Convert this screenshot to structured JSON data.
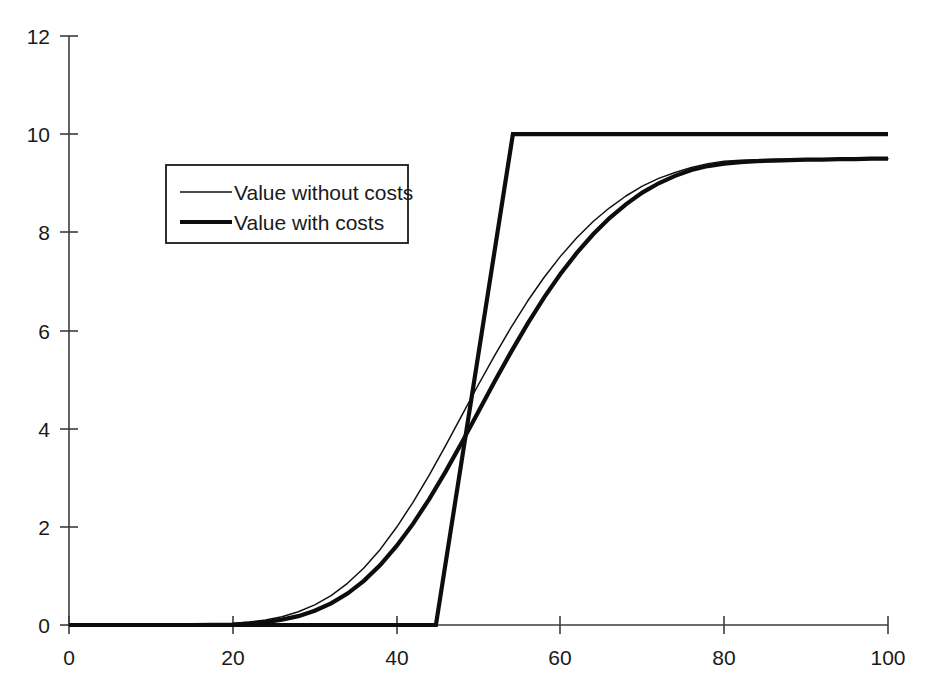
{
  "chart_data": {
    "type": "line",
    "title": "",
    "subtitle": "",
    "xlabel": "",
    "ylabel": "",
    "xlim": [
      0,
      100
    ],
    "ylim": [
      0,
      12
    ],
    "grid": false,
    "legend_position": "upper-left-center",
    "xticks": [
      0,
      20,
      40,
      60,
      80,
      100
    ],
    "xtick_labels": [
      "0",
      "20",
      "40",
      "60",
      "80",
      "100"
    ],
    "yticks": [
      0,
      2,
      4,
      6,
      8,
      10,
      12
    ],
    "ytick_labels": [
      "0",
      "2",
      "4",
      "6",
      "8",
      "10",
      "12"
    ],
    "annotations": [],
    "series": [
      {
        "name": "Value without costs",
        "style": "thin",
        "color": "#111111",
        "x": [
          0,
          5,
          10,
          15,
          20,
          22,
          24,
          26,
          28,
          30,
          32,
          34,
          36,
          38,
          40,
          42,
          44,
          46,
          48,
          50,
          52,
          54,
          56,
          58,
          60,
          62,
          64,
          66,
          68,
          70,
          72,
          74,
          76,
          78,
          80,
          82,
          84,
          86,
          88,
          90,
          92,
          94,
          96,
          98,
          100
        ],
        "y": [
          0.0,
          0.0,
          0.0,
          0.01,
          0.03,
          0.06,
          0.1,
          0.17,
          0.27,
          0.41,
          0.6,
          0.85,
          1.16,
          1.54,
          1.99,
          2.5,
          3.06,
          3.66,
          4.28,
          4.9,
          5.5,
          6.07,
          6.6,
          7.08,
          7.51,
          7.89,
          8.22,
          8.5,
          8.74,
          8.94,
          9.1,
          9.22,
          9.32,
          9.4,
          9.45,
          9.47,
          9.48,
          9.49,
          9.49,
          9.5,
          9.5,
          9.5,
          9.5,
          9.5,
          9.5
        ]
      },
      {
        "name": "Value with costs",
        "style": "thick",
        "color": "#0d0d0d",
        "x": [
          0,
          5,
          10,
          15,
          20,
          22,
          24,
          26,
          28,
          30,
          32,
          34,
          36,
          38,
          40,
          42,
          44,
          46,
          48,
          50,
          52,
          54,
          56,
          58,
          60,
          62,
          64,
          66,
          68,
          70,
          72,
          74,
          76,
          78,
          80,
          82,
          84,
          86,
          88,
          90,
          92,
          94,
          96,
          98,
          100
        ],
        "y": [
          0.0,
          0.0,
          0.0,
          0.0,
          0.01,
          0.03,
          0.06,
          0.11,
          0.18,
          0.29,
          0.44,
          0.64,
          0.9,
          1.22,
          1.61,
          2.06,
          2.57,
          3.13,
          3.73,
          4.35,
          4.97,
          5.57,
          6.14,
          6.67,
          7.15,
          7.58,
          7.96,
          8.29,
          8.57,
          8.81,
          9.0,
          9.15,
          9.27,
          9.35,
          9.4,
          9.43,
          9.45,
          9.46,
          9.47,
          9.48,
          9.48,
          9.49,
          9.49,
          9.5,
          9.5
        ]
      },
      {
        "name": "Exercise boundary",
        "style": "thick",
        "color": "#0d0d0d",
        "x": [
          0,
          44.8,
          54.2,
          100
        ],
        "y": [
          0,
          0,
          10,
          10
        ]
      }
    ]
  },
  "legend": {
    "entries": [
      {
        "label": "Value without costs",
        "style": "thin"
      },
      {
        "label": "Value with costs",
        "style": "thick"
      }
    ]
  },
  "axes": {
    "x_axis_name": "x-axis",
    "y_axis_name": "y-axis"
  }
}
